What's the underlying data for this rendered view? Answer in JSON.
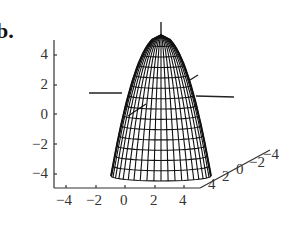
{
  "figure": {
    "panel_label": "b.",
    "colors": {
      "ink": "#111111",
      "axis": "#333333",
      "background": "#ffffff"
    }
  },
  "chart_data": {
    "type": "surface3d",
    "title": "",
    "surface": {
      "shape": "paraboloid",
      "opening": "downward",
      "apex_z_approx": 5,
      "base_z_approx": -4,
      "mesh": "wireframe",
      "base_radius_approx": 3
    },
    "axes": {
      "x": {
        "label": "",
        "ticks": [
          "-4",
          "-2",
          "0",
          "2",
          "4"
        ],
        "range": [
          -4,
          4
        ]
      },
      "y": {
        "label": "",
        "ticks": [
          "4",
          "2",
          "0",
          "-2",
          "-4"
        ],
        "range": [
          -4,
          4
        ]
      },
      "z": {
        "label": "",
        "ticks": [
          "4",
          "2",
          "0",
          "-2",
          "-4"
        ],
        "range": [
          -5,
          5
        ]
      }
    },
    "grid": false,
    "legend": null
  },
  "ticks": {
    "z": [
      {
        "label": "4",
        "y": 47
      },
      {
        "label": "2",
        "y": 77
      },
      {
        "label": "0",
        "y": 107
      },
      {
        "label": "−2",
        "y": 137
      },
      {
        "label": "−4",
        "y": 166
      }
    ],
    "x": [
      {
        "label": "−4",
        "x": 56
      },
      {
        "label": "−2",
        "x": 86
      },
      {
        "label": "0",
        "x": 120
      },
      {
        "label": "2",
        "x": 150
      },
      {
        "label": "4",
        "x": 179
      }
    ],
    "y": [
      {
        "label": "4",
        "x": 208,
        "y": 191
      },
      {
        "label": "2",
        "x": 222,
        "y": 183
      },
      {
        "label": "0",
        "x": 236,
        "y": 176
      },
      {
        "label": "−2",
        "x": 249,
        "y": 169
      },
      {
        "label": "−4",
        "x": 263,
        "y": 161
      }
    ]
  }
}
